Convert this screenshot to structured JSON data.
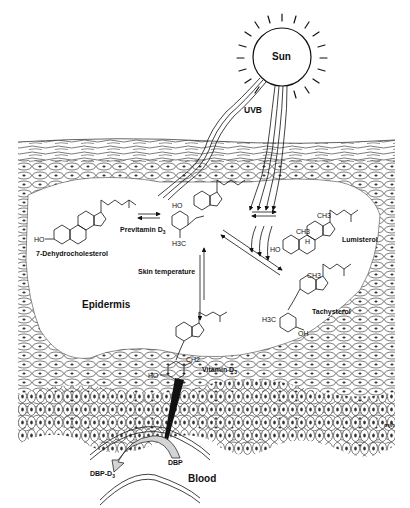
{
  "diagram": {
    "labels": {
      "sun": "Sun",
      "uvb": "UVB",
      "dehydrocholesterol": "7-Dehydrocholesterol",
      "previtamin": "Previtamin D",
      "previtamin_sub": "3",
      "lumisterol": "Lumisterol",
      "tachysterol": "Tachysterol",
      "skin_temperature": "Skin temperature",
      "epidermis": "Epidermis",
      "vitamin": "Vitamin D",
      "vitamin_sub": "3",
      "dbp": "DBP",
      "dbp_d3": "DBP-D",
      "dbp_d3_sub": "3",
      "blood": "Blood",
      "signature": "mjh"
    },
    "molecule_groups": {
      "ho": "HO",
      "oh": "OH",
      "h3c": "H3C",
      "ch3": "CH3",
      "ch2": "CH2",
      "h": "H"
    },
    "colors": {
      "ink": "#111111",
      "background": "#ffffff",
      "dbp_fill": "#d4d4d4",
      "nucleus": "#333333"
    }
  }
}
